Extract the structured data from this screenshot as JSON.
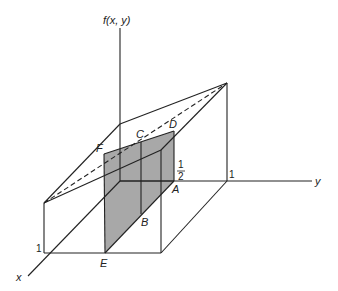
{
  "diagram": {
    "axes": {
      "vertical_label": "f(x, y)",
      "x_label": "x",
      "y_label": "y"
    },
    "ticks": {
      "x_one": "1",
      "y_one": "1",
      "y_half_num": "1",
      "y_half_den": "2"
    },
    "points": {
      "A": "A",
      "B": "B",
      "C": "C",
      "D": "D",
      "E": "E",
      "F": "F"
    },
    "colors": {
      "line": "#222222",
      "shade": "#a8a8a8"
    }
  }
}
